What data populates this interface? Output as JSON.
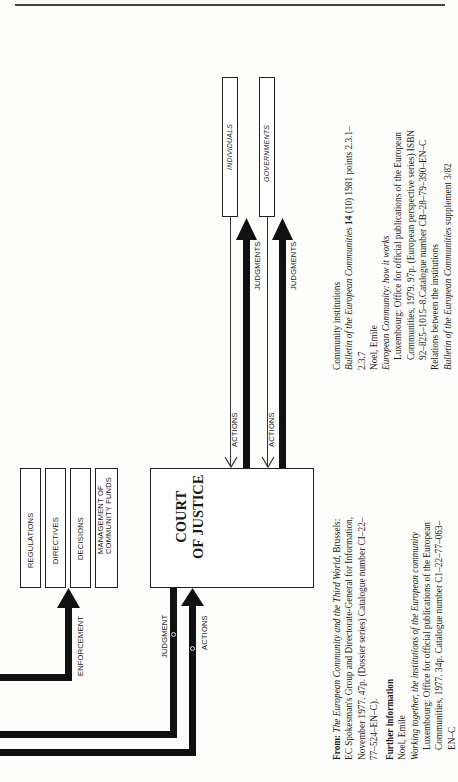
{
  "diagram": {
    "instrument_boxes": [
      {
        "label": "REGULATIONS"
      },
      {
        "label": "DIRECTIVES"
      },
      {
        "label": "DECISIONS"
      },
      {
        "label": "MANAGEMENT OF",
        "label2": "COMMUNITY FUNDS"
      }
    ],
    "court_box": {
      "line1": "COURT",
      "line2": "OF JUSTICE"
    },
    "party_boxes": [
      {
        "label": "INDIVIDUALS"
      },
      {
        "label": "GOVERNMENTS"
      }
    ],
    "arrow_labels": {
      "enforcement": "ENFORCEMENT",
      "judgment": "JUDGMENT",
      "actions_bottom": "ACTIONS",
      "actions_individuals": "ACTIONS",
      "actions_governments": "ACTIONS",
      "judgments_individuals": "JUDGMENTS",
      "judgments_governments": "JUDGMENTS"
    }
  },
  "source": {
    "from_label": "From:",
    "title": "The European Community and the Third World",
    "rest1": ", Brussels:",
    "line2": "EC Spokesman's Group and Directorate-General for Information,",
    "line3": "November 1977. 47p. (Dossier series) Catalogue number CI–22–",
    "line4": "77–524–EN–C)."
  },
  "further_information": {
    "heading": "Further information",
    "entries": [
      {
        "author": "Noel, Emile",
        "title": "Working together, the institutions of the European community",
        "lines": [
          "Luxembourg: Office for official publications of the European",
          "Communities, 1977. 34p. Catalogue number C1–22–77–063–",
          "EN–C"
        ]
      },
      {
        "subject": "Community institutions",
        "journal": "Bulletin of the European Communities",
        "volume": "14",
        "rest": " (10) 1981 points 2.3.1–",
        "cont": "2.3.7"
      },
      {
        "author": "Noel, Emile",
        "title": "European Community: how it works",
        "lines": [
          "Luxembourg: Office for official publications of the European",
          "Communities, 1979. 97p. (European perspective series) ISBN",
          "92–825–1015–8.Catalogue number CB–28–79–390–EN–C"
        ]
      },
      {
        "subject": "Relations between the institutions",
        "journal": "Bulletin of the European Communities",
        "rest": " supplement 3/82"
      }
    ]
  }
}
